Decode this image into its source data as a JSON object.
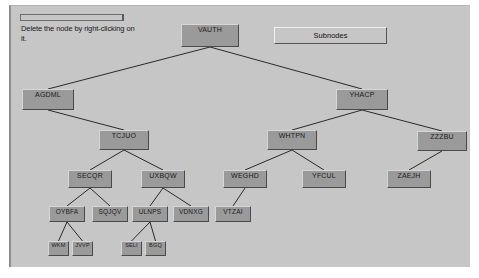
{
  "window": {
    "title": "Node Tree Editor",
    "background_color": "#c6c6c6"
  },
  "hint": {
    "text": "Delete the node  by right-clicking on it."
  },
  "toolbar": {
    "subnodes_label": "Subnodes"
  },
  "tree": {
    "nodes": [
      {
        "id": "n0",
        "label": "VAUTH",
        "level": 0,
        "x": 170,
        "y": 18
      },
      {
        "id": "n1",
        "label": "AGDML",
        "level": 1,
        "x": 11,
        "y": 83
      },
      {
        "id": "n2",
        "label": "YHACP",
        "level": 1,
        "x": 325,
        "y": 83
      },
      {
        "id": "n3",
        "label": "TCJUO",
        "level": 2,
        "x": 88,
        "y": 124
      },
      {
        "id": "n4",
        "label": "WHTPN",
        "level": 2,
        "x": 256,
        "y": 124
      },
      {
        "id": "n5",
        "label": "ZZZBU",
        "level": 2,
        "x": 406,
        "y": 125
      },
      {
        "id": "n6",
        "label": "SECQR",
        "level": 3,
        "x": 57,
        "y": 164
      },
      {
        "id": "n7",
        "label": "UXBQW",
        "level": 3,
        "x": 130,
        "y": 164
      },
      {
        "id": "n8",
        "label": "WEGHD",
        "level": 3,
        "x": 212,
        "y": 164
      },
      {
        "id": "n9",
        "label": "YFCUL",
        "level": 3,
        "x": 291,
        "y": 164
      },
      {
        "id": "n10",
        "label": "ZAEJH",
        "level": 3,
        "x": 376,
        "y": 164
      },
      {
        "id": "n11",
        "label": "OYBFA",
        "level": 4,
        "x": 38,
        "y": 200
      },
      {
        "id": "n12",
        "label": "SQJQV",
        "level": 4,
        "x": 81,
        "y": 200
      },
      {
        "id": "n13",
        "label": "ULNPS",
        "level": 4,
        "x": 121,
        "y": 200
      },
      {
        "id": "n14",
        "label": "VDNXG",
        "level": 4,
        "x": 162,
        "y": 200
      },
      {
        "id": "n15",
        "label": "VTZAI",
        "level": 4,
        "x": 204,
        "y": 200
      },
      {
        "id": "n16",
        "label": "WKM",
        "level": 5,
        "x": 37,
        "y": 235
      },
      {
        "id": "n17",
        "label": "JVVP",
        "level": 5,
        "x": 61,
        "y": 235
      },
      {
        "id": "n18",
        "label": "SELI",
        "level": 5,
        "x": 110,
        "y": 235
      },
      {
        "id": "n19",
        "label": "BGQ",
        "level": 5,
        "x": 134,
        "y": 235
      }
    ],
    "edges": [
      {
        "from": "n0",
        "to": "n1"
      },
      {
        "from": "n0",
        "to": "n2"
      },
      {
        "from": "n1",
        "to": "n3"
      },
      {
        "from": "n2",
        "to": "n4"
      },
      {
        "from": "n2",
        "to": "n5"
      },
      {
        "from": "n3",
        "to": "n6"
      },
      {
        "from": "n3",
        "to": "n7"
      },
      {
        "from": "n4",
        "to": "n8"
      },
      {
        "from": "n4",
        "to": "n9"
      },
      {
        "from": "n5",
        "to": "n10"
      },
      {
        "from": "n6",
        "to": "n11"
      },
      {
        "from": "n6",
        "to": "n12"
      },
      {
        "from": "n7",
        "to": "n13"
      },
      {
        "from": "n7",
        "to": "n14"
      },
      {
        "from": "n8",
        "to": "n15"
      },
      {
        "from": "n11",
        "to": "n16"
      },
      {
        "from": "n11",
        "to": "n17"
      },
      {
        "from": "n13",
        "to": "n18"
      },
      {
        "from": "n13",
        "to": "n19"
      }
    ],
    "node_color": "#9a9a9a",
    "edge_color": "#2a2a2a"
  }
}
